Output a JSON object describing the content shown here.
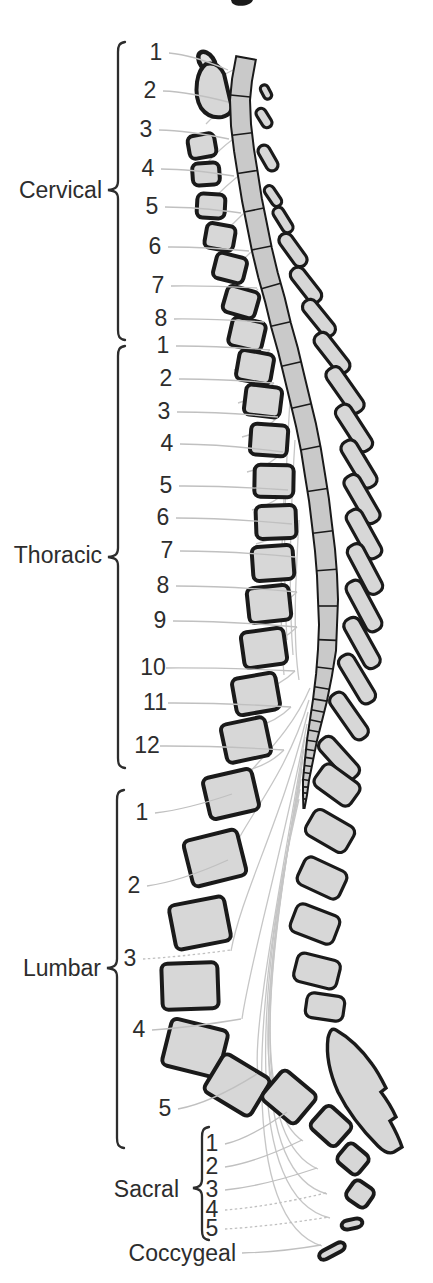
{
  "regions": [
    {
      "name": "Cervical",
      "numbers": [
        "1",
        "2",
        "3",
        "4",
        "5",
        "6",
        "7",
        "8"
      ]
    },
    {
      "name": "Thoracic",
      "numbers": [
        "1",
        "2",
        "3",
        "4",
        "5",
        "6",
        "7",
        "8",
        "9",
        "10",
        "11",
        "12"
      ]
    },
    {
      "name": "Lumbar",
      "numbers": [
        "1",
        "2",
        "3",
        "4",
        "5"
      ]
    },
    {
      "name": "Sacral",
      "numbers": [
        "1",
        "2",
        "3",
        "4",
        "5"
      ]
    },
    {
      "name": "Coccygeal",
      "numbers": []
    }
  ],
  "colors": {
    "background": "#ffffff",
    "bone_fill": "#d7d7d7",
    "outline": "#1a1a1a",
    "cord_fill": "#c9c9c9",
    "leader_line": "#c0c0c0",
    "nerve_line": "#c6c6c6",
    "label_text": "#2d2d2d",
    "brace": "#2d2d2d"
  }
}
